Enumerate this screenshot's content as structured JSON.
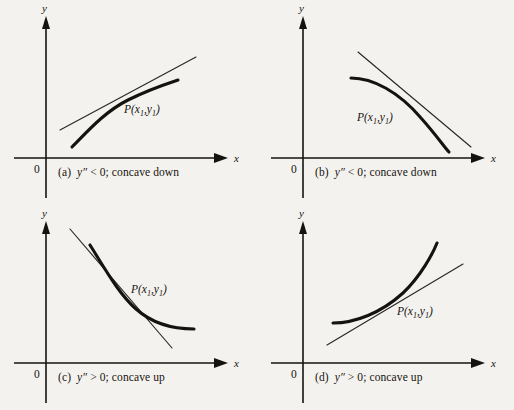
{
  "figure": {
    "background_color": "#f4f2ee",
    "ink_color": "#15130f",
    "axis_labels": {
      "x": "x",
      "y": "y",
      "origin": "0"
    },
    "point_label": {
      "prefix": "P(x",
      "sub1": "1",
      "comma": ",y",
      "sub2": "1",
      "suffix": ")"
    }
  },
  "panels": [
    {
      "id": "panel-a",
      "tag": "(a)",
      "expression": "y″",
      "relation": "< 0;",
      "concavity": "concave down",
      "caption_full": "(a)  y″ < 0; concave down",
      "point_label": "P(x₁,y₁)",
      "axis_label_x": "x",
      "axis_label_y": "y",
      "origin": "0",
      "curve_shape": "increasing-concave-down",
      "second_derivative_sign": "negative",
      "first_derivative_sign": "positive"
    },
    {
      "id": "panel-b",
      "tag": "(b)",
      "expression": "y″",
      "relation": "< 0;",
      "concavity": "concave down",
      "caption_full": "(b)  y″ < 0; concave down",
      "point_label": "P(x₁,y₁)",
      "axis_label_x": "x",
      "axis_label_y": "y",
      "origin": "0",
      "curve_shape": "decreasing-concave-down",
      "second_derivative_sign": "negative",
      "first_derivative_sign": "negative"
    },
    {
      "id": "panel-c",
      "tag": "(c)",
      "expression": "y″",
      "relation": "> 0;",
      "concavity": "concave up",
      "caption_full": "(c)  y″ > 0; concave up",
      "point_label": "P(x₁,y₁)",
      "axis_label_x": "x",
      "axis_label_y": "y",
      "origin": "0",
      "curve_shape": "decreasing-concave-up",
      "second_derivative_sign": "positive",
      "first_derivative_sign": "negative"
    },
    {
      "id": "panel-d",
      "tag": "(d)",
      "expression": "y″",
      "relation": "> 0;",
      "concavity": "concave up",
      "caption_full": "(d)  y″ > 0; concave up",
      "point_label": "P(x₁,y₁)",
      "axis_label_x": "x",
      "axis_label_y": "y",
      "origin": "0",
      "curve_shape": "increasing-concave-up",
      "second_derivative_sign": "positive",
      "first_derivative_sign": "positive"
    }
  ]
}
